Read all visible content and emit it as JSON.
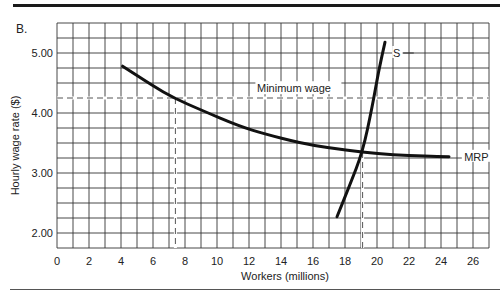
{
  "panel_label": "B.",
  "chart_data": {
    "type": "line",
    "title": "",
    "xlabel": "Workers (millions)",
    "ylabel": "Hourly wage rate ($)",
    "xlim": [
      0,
      27
    ],
    "ylim": [
      1.75,
      5.5
    ],
    "grid": true,
    "x_ticks": [
      "0",
      "2",
      "4",
      "6",
      "8",
      "10",
      "12",
      "14",
      "16",
      "18",
      "20",
      "22",
      "24",
      "26"
    ],
    "y_ticks": [
      "2.00",
      "3.00",
      "4.00",
      "5.00"
    ],
    "series": [
      {
        "name": "MRP",
        "points": [
          [
            4.1,
            4.78
          ],
          [
            6,
            4.45
          ],
          [
            7.3,
            4.25
          ],
          [
            9,
            4.05
          ],
          [
            11.4,
            3.78
          ],
          [
            13,
            3.65
          ],
          [
            15.2,
            3.5
          ],
          [
            17,
            3.42
          ],
          [
            19.1,
            3.35
          ],
          [
            21,
            3.3
          ],
          [
            23,
            3.28
          ],
          [
            24.5,
            3.27
          ]
        ]
      },
      {
        "name": "S",
        "points": [
          [
            17.5,
            2.27
          ],
          [
            18.3,
            2.8
          ],
          [
            19.1,
            3.35
          ],
          [
            19.7,
            4.1
          ],
          [
            20.1,
            4.7
          ],
          [
            20.5,
            5.18
          ]
        ]
      }
    ],
    "reference_lines": [
      {
        "label": "Minimum wage",
        "orientation": "horizontal",
        "y": 4.25,
        "style": "dashed"
      },
      {
        "orientation": "vertical",
        "x": 7.4,
        "style": "dashed",
        "from_y": 1.75,
        "to_y": 4.25
      },
      {
        "orientation": "vertical",
        "x": 19.1,
        "style": "dashed",
        "from_y": 1.75,
        "to_y": 3.35
      }
    ],
    "annotations": [
      {
        "text": "S",
        "near": [
          21,
          5.0
        ]
      },
      {
        "text": "MRP",
        "near": [
          25.5,
          3.27
        ]
      },
      {
        "text": "Minimum wage",
        "near": [
          15,
          4.35
        ]
      }
    ]
  }
}
